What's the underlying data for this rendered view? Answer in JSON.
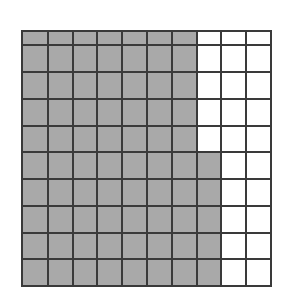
{
  "figure": {
    "name": "shaded-grid",
    "rows": 10,
    "columns": 10,
    "total_cells": 100,
    "shaded_cells": 75,
    "unshaded_cells": 25,
    "shaded_fraction": "75/100",
    "shaded_percent": "75%"
  },
  "colors": {
    "background": "#ffffff",
    "grid_line": "#3a3a3a",
    "shaded_fill": "#a9a9a9",
    "unshaded_fill": "#ffffff"
  },
  "chart_data": {
    "type": "heatmap",
    "title": "",
    "subtitle": "",
    "xlabel": "",
    "ylabel": "",
    "rows": 10,
    "columns": 10,
    "legend": [
      {
        "key": "shaded",
        "label": "Shaded",
        "color": "#a9a9a9",
        "value": 1
      },
      {
        "key": "unshaded",
        "label": "Unshaded",
        "color": "#ffffff",
        "value": 0
      }
    ],
    "row_shaded_counts": [
      7,
      7,
      7,
      7,
      7,
      8,
      8,
      8,
      8,
      8
    ],
    "column_shaded_counts": [
      10,
      10,
      10,
      10,
      10,
      10,
      10,
      5,
      0,
      0
    ],
    "grid": [
      [
        1,
        1,
        1,
        1,
        1,
        1,
        1,
        0,
        0,
        0
      ],
      [
        1,
        1,
        1,
        1,
        1,
        1,
        1,
        0,
        0,
        0
      ],
      [
        1,
        1,
        1,
        1,
        1,
        1,
        1,
        0,
        0,
        0
      ],
      [
        1,
        1,
        1,
        1,
        1,
        1,
        1,
        0,
        0,
        0
      ],
      [
        1,
        1,
        1,
        1,
        1,
        1,
        1,
        0,
        0,
        0
      ],
      [
        1,
        1,
        1,
        1,
        1,
        1,
        1,
        1,
        0,
        0
      ],
      [
        1,
        1,
        1,
        1,
        1,
        1,
        1,
        1,
        0,
        0
      ],
      [
        1,
        1,
        1,
        1,
        1,
        1,
        1,
        1,
        0,
        0
      ],
      [
        1,
        1,
        1,
        1,
        1,
        1,
        1,
        1,
        0,
        0
      ],
      [
        1,
        1,
        1,
        1,
        1,
        1,
        1,
        1,
        0,
        0
      ]
    ]
  }
}
